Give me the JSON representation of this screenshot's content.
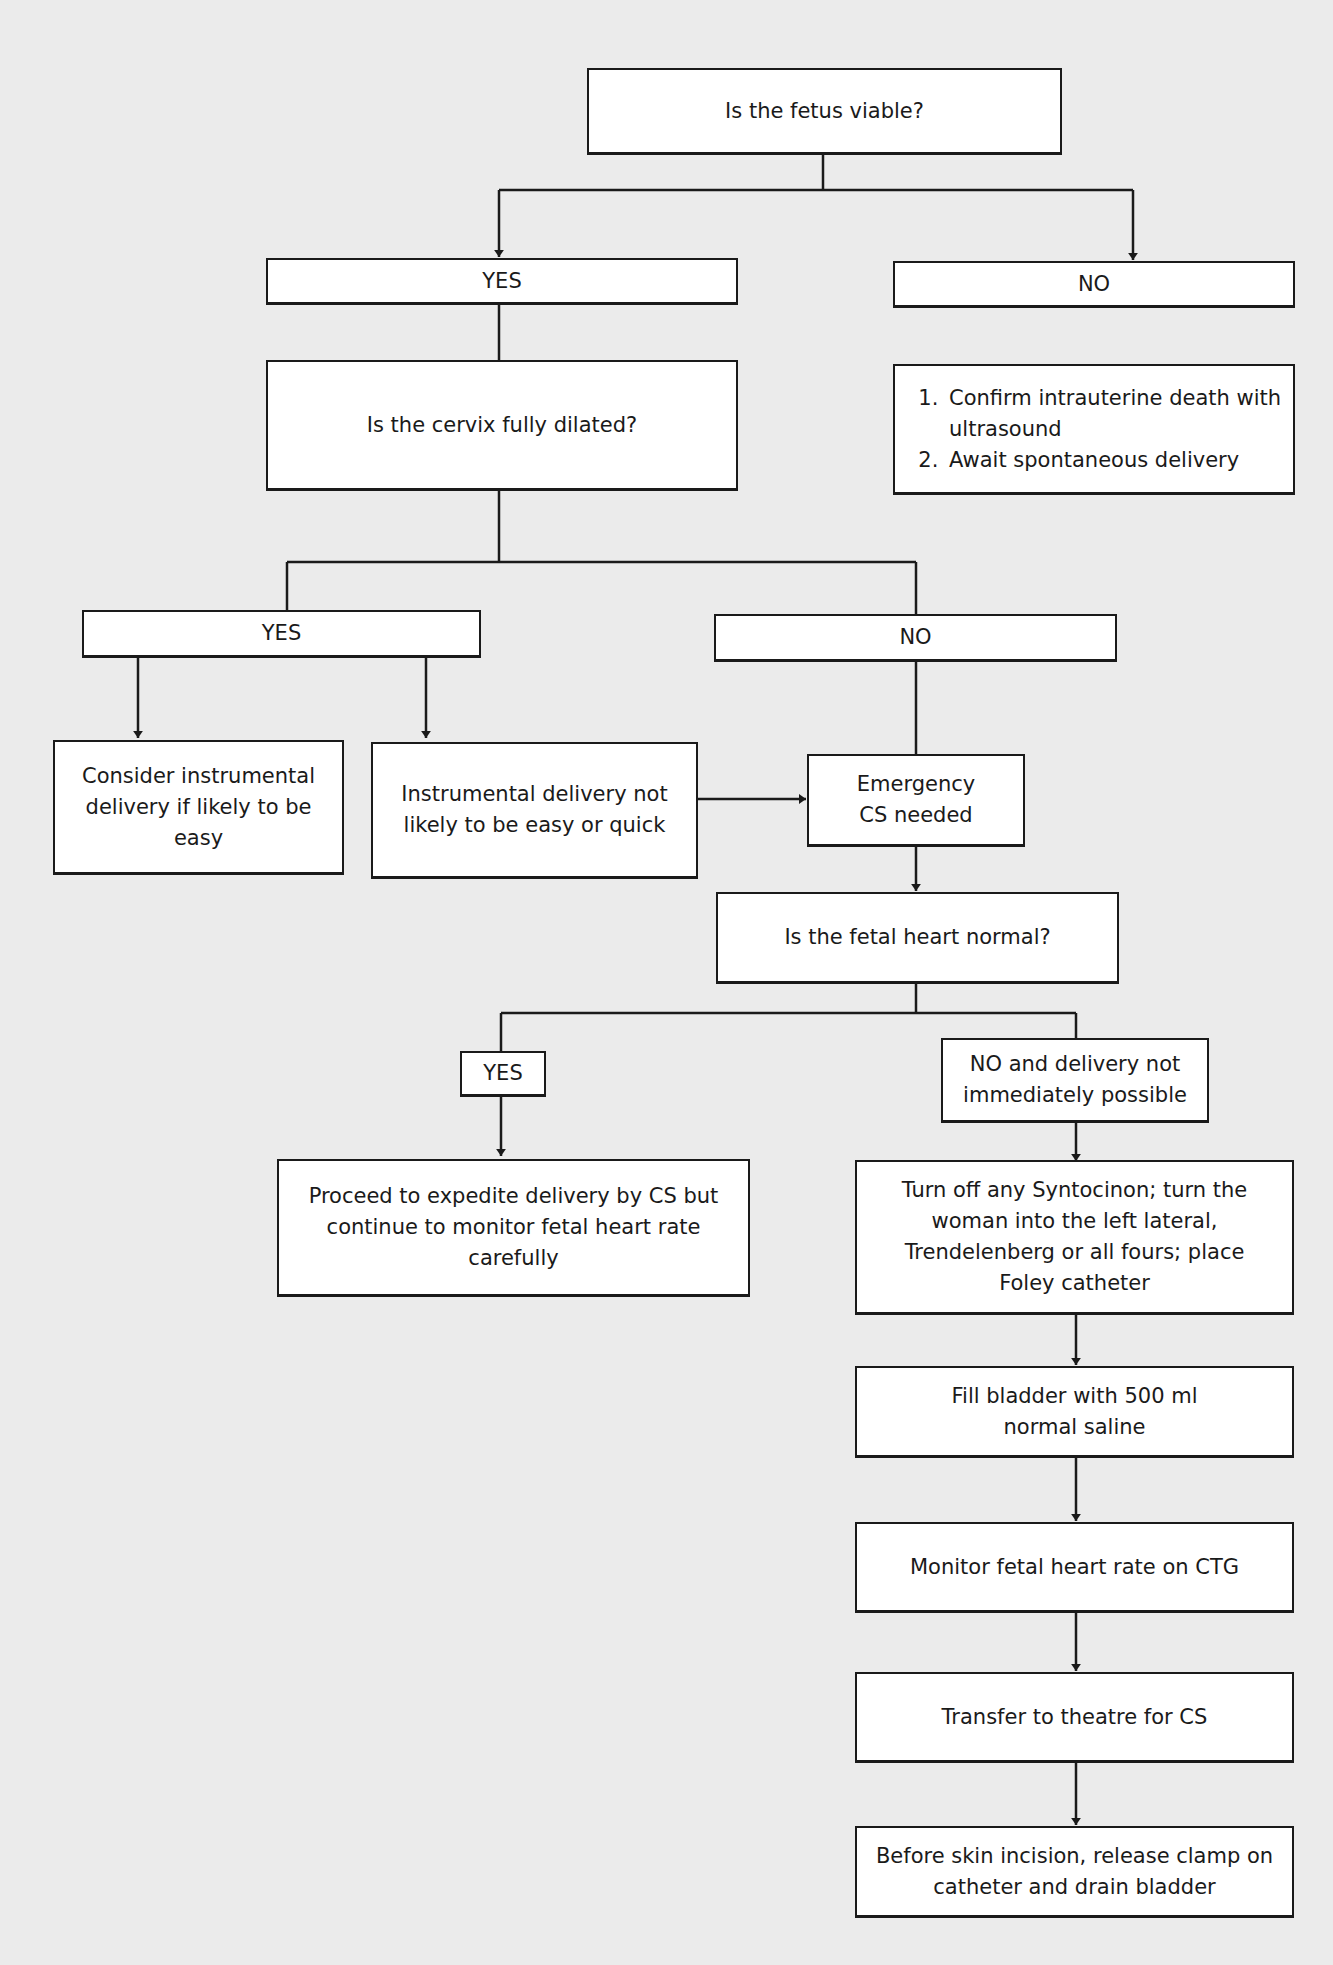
{
  "diagram": {
    "type": "flowchart",
    "nodes": {
      "q_viable": "Is the fetus viable?",
      "viable_yes": "YES",
      "viable_no": "NO",
      "q_cervix": "Is the cervix fully dilated?",
      "no_steps": [
        "Confirm intrauterine death with ultrasound",
        "Await spontaneous delivery"
      ],
      "cervix_yes": "YES",
      "cervix_no": "NO",
      "consider_instrumental": "Consider instrumental delivery if likely to be easy",
      "instrumental_not_easy": "Instrumental delivery not likely to be easy or quick",
      "emergency_cs": "Emergency CS needed",
      "q_fetal_heart": "Is the fetal heart normal?",
      "heart_yes": "YES",
      "heart_no": "NO and delivery not immediately possible",
      "expedite_cs": "Proceed to expedite delivery by CS but continue to monitor fetal heart rate carefully",
      "turn_off_syntocinon": "Turn off any Syntocinon; turn the woman into the left lateral, Trendelenberg or all fours; place Foley catheter",
      "fill_bladder": "Fill bladder with 500 ml normal saline",
      "monitor_ctg": "Monitor fetal heart rate on CTG",
      "transfer_theatre": "Transfer to theatre for CS",
      "release_clamp": "Before skin incision, release clamp on catheter and drain bladder"
    },
    "edges": [
      [
        "q_viable",
        "viable_yes"
      ],
      [
        "q_viable",
        "viable_no"
      ],
      [
        "viable_yes",
        "q_cervix"
      ],
      [
        "viable_no",
        "no_steps"
      ],
      [
        "q_cervix",
        "cervix_yes"
      ],
      [
        "q_cervix",
        "cervix_no"
      ],
      [
        "cervix_yes",
        "consider_instrumental"
      ],
      [
        "cervix_yes",
        "instrumental_not_easy"
      ],
      [
        "instrumental_not_easy",
        "emergency_cs"
      ],
      [
        "cervix_no",
        "emergency_cs"
      ],
      [
        "emergency_cs",
        "q_fetal_heart"
      ],
      [
        "q_fetal_heart",
        "heart_yes"
      ],
      [
        "q_fetal_heart",
        "heart_no"
      ],
      [
        "heart_yes",
        "expedite_cs"
      ],
      [
        "heart_no",
        "turn_off_syntocinon"
      ],
      [
        "turn_off_syntocinon",
        "fill_bladder"
      ],
      [
        "fill_bladder",
        "monitor_ctg"
      ],
      [
        "monitor_ctg",
        "transfer_theatre"
      ],
      [
        "transfer_theatre",
        "release_clamp"
      ]
    ],
    "colors": {
      "background": "#ebebeb",
      "box_fill": "#ffffff",
      "stroke": "#1a1a1a"
    }
  }
}
